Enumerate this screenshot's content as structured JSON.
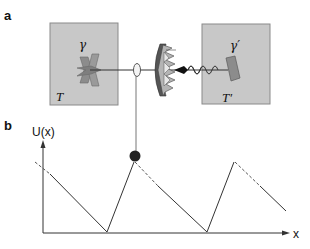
{
  "panel_a": {
    "label": "a",
    "left_reservoir": {
      "temperature_label": "T",
      "vane_label": "γ"
    },
    "right_reservoir": {
      "temperature_label": "T′",
      "paddle_label": "γ′"
    }
  },
  "panel_b": {
    "label": "b",
    "y_axis_label": "U(x)",
    "x_axis_label": "x"
  },
  "colors": {
    "reservoir_fill": "#c8c8c8",
    "reservoir_border": "#888888",
    "vane_fill": "#8c8c8c",
    "line": "#333333",
    "weight": "#222222"
  }
}
